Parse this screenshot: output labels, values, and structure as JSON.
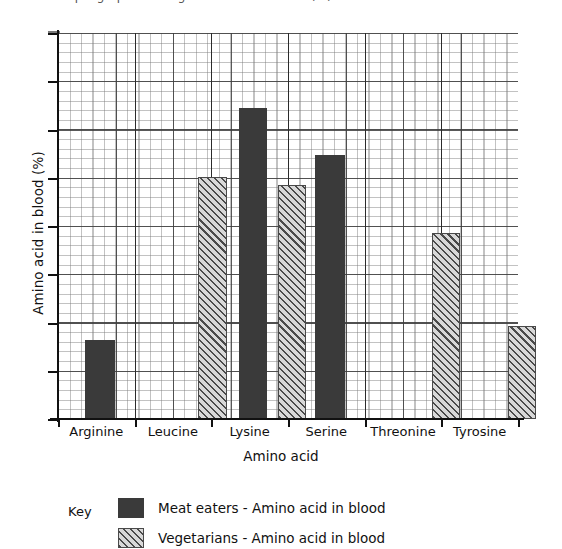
{
  "top_clipped_text": "Sample graph showing amino acid in blood (%)",
  "chart_data": {
    "type": "bar",
    "title": "",
    "xlabel": "Amino acid",
    "ylabel": "Amino acid in blood (%)",
    "categories": [
      "Arginine",
      "Leucine",
      "Lysine",
      "Serine",
      "Threonine",
      "Tyrosine"
    ],
    "ylim": [
      0,
      8
    ],
    "y_tick_count": 8,
    "y_tick_labels": [],
    "grid": true,
    "grid_style": "graph-paper",
    "legend_position": "below-axes",
    "series": [
      {
        "name": "Meat eaters - Amino acid in blood",
        "style": "solid",
        "color": "#3a3a3a",
        "values": [
          1.65,
          null,
          6.4,
          5.45,
          null,
          null
        ]
      },
      {
        "name": "Vegetarians - Amino acid in blood",
        "style": "hatched",
        "color": "#d8d8d8",
        "hatch_color": "#4a4a4a",
        "values": [
          null,
          4.9,
          4.6,
          null,
          3.8,
          1.85
        ]
      }
    ],
    "bars": [
      {
        "category": "Arginine",
        "series": "Meat eaters - Amino acid in blood",
        "value": 1.65,
        "style": "solid",
        "left_px": 85,
        "width_px": 30,
        "top_px": 340
      },
      {
        "category": "Leucine",
        "series": "Vegetarians - Amino acid in blood",
        "value": 4.9,
        "style": "hatch",
        "left_px": 198,
        "width_px": 29,
        "top_px": 177
      },
      {
        "category": "Lysine",
        "series": "Meat eaters - Amino acid in blood",
        "value": 6.4,
        "style": "solid",
        "left_px": 239,
        "width_px": 28,
        "top_px": 108
      },
      {
        "category": "Lysine",
        "series": "Vegetarians - Amino acid in blood",
        "value": 4.6,
        "style": "hatch",
        "left_px": 278,
        "width_px": 28,
        "top_px": 185
      },
      {
        "category": "Serine",
        "series": "Meat eaters - Amino acid in blood",
        "value": 5.45,
        "style": "solid",
        "left_px": 315,
        "width_px": 30,
        "top_px": 155
      },
      {
        "category": "Threonine",
        "series": "Vegetarians - Amino acid in blood",
        "value": 3.8,
        "style": "hatch",
        "left_px": 432,
        "width_px": 28,
        "top_px": 233
      },
      {
        "category": "Tyrosine",
        "series": "Vegetarians - Amino acid in blood",
        "value": 1.85,
        "style": "hatch",
        "left_px": 508,
        "width_px": 28,
        "top_px": 326
      }
    ]
  },
  "legend": {
    "key_word": "Key",
    "entries": [
      {
        "label": "Meat eaters - Amino acid in blood",
        "style": "solid"
      },
      {
        "label": "Vegetarians - Amino acid in blood",
        "style": "hatch"
      }
    ]
  }
}
